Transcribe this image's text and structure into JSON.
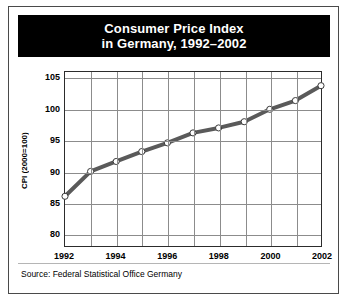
{
  "title": {
    "line1": "Consumer Price Index",
    "line2": "in Germany, 1992–2002"
  },
  "source_note": "Source: Federal Statistical Office Germany",
  "colors": {
    "banner_background": "#000000",
    "banner_text": "#ffffff",
    "series_line": "#5a5a5a",
    "marker_fill": "#ffffff",
    "marker_stroke": "#3a3a3a",
    "gridline": "#8c8c8c",
    "frame": "#2c2c2c",
    "page_background": "#ffffff"
  },
  "chart_data": {
    "type": "line",
    "title": "Consumer Price Index in Germany, 1992–2002",
    "xlabel": "",
    "ylabel": "CPI (2000=100)",
    "x": [
      1992,
      1993,
      1994,
      1995,
      1996,
      1997,
      1998,
      1999,
      2000,
      2001,
      2002
    ],
    "values": [
      86.0,
      90.0,
      91.6,
      93.2,
      94.6,
      96.2,
      97.0,
      98.0,
      100.0,
      101.4,
      103.8
    ],
    "series": [
      {
        "name": "CPI (2000=100)",
        "values": [
          86.0,
          90.0,
          91.6,
          93.2,
          94.6,
          96.2,
          97.0,
          98.0,
          100.0,
          101.4,
          103.8
        ]
      }
    ],
    "xlim": [
      1992,
      2002
    ],
    "ylim": [
      78,
      106
    ],
    "ytick_labels": [
      "105",
      "100",
      "95",
      "90",
      "85",
      "80"
    ],
    "ytick_values": [
      105,
      100,
      95,
      90,
      85,
      80
    ],
    "xtick_labels": [
      "1992",
      "1994",
      "1996",
      "1998",
      "2000",
      "2002"
    ],
    "xtick_values": [
      1992,
      1994,
      1996,
      1998,
      2000,
      2002
    ],
    "grid": true,
    "legend": "none",
    "markers": "circle"
  }
}
